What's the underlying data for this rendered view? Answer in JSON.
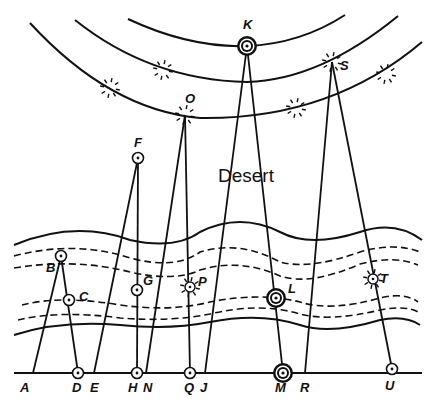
{
  "diagram": {
    "region_label": "Desert",
    "colors": {
      "ink": "#111111",
      "background": "#ffffff"
    },
    "baseline": {
      "y": 373,
      "x1": 14,
      "x2": 422
    },
    "arcs": [
      {
        "id": "inner",
        "path": "M128,19 Q190,48 247,46 Q300,44 345,15"
      },
      {
        "id": "middle",
        "path": "M75,20 Q150,80 247,82 Q320,80 398,16"
      },
      {
        "id": "outer",
        "path": "M30,23 Q110,110 200,118 Q330,120 422,42"
      }
    ],
    "river": {
      "solid": [
        "M14,245 Q75,220 130,240 Q175,250 200,232 Q240,212 280,232 Q310,248 360,232 Q395,220 422,240",
        "M14,335 Q60,320 120,325 Q170,330 210,322 Q260,312 300,325 Q330,335 380,320 Q405,315 420,325"
      ],
      "dashed": [
        "M14,256 Q75,240 130,258 Q175,270 200,252 Q240,240 280,262 Q310,270 360,252 Q395,242 420,252",
        "M14,268 Q75,258 130,272 Q175,282 200,270 Q240,258 280,276 Q310,286 360,264 Q395,255 418,265",
        "M22,305 Q60,295 120,305 Q170,312 210,302 Q260,292 300,302 Q330,312 380,298 Q405,292 418,302",
        "M18,320 Q60,310 120,318 Q170,322 210,314 Q260,302 300,314 Q330,322 380,310 Q405,305 418,312"
      ]
    },
    "points": [
      {
        "label": "A",
        "x": 33,
        "y": 373,
        "marker": "none",
        "lx": 20,
        "ly": 392
      },
      {
        "label": "B",
        "x": 61,
        "y": 256,
        "marker": "ring",
        "lx": 46,
        "ly": 272
      },
      {
        "label": "C",
        "x": 69,
        "y": 300,
        "marker": "ring",
        "lx": 79,
        "ly": 301
      },
      {
        "label": "D",
        "x": 78,
        "y": 373,
        "marker": "ring",
        "lx": 72,
        "ly": 392
      },
      {
        "label": "E",
        "x": 94,
        "y": 373,
        "marker": "none",
        "lx": 90,
        "ly": 392
      },
      {
        "label": "F",
        "x": 138,
        "y": 158,
        "marker": "ring",
        "lx": 134,
        "ly": 147
      },
      {
        "label": "G",
        "x": 137,
        "y": 290,
        "marker": "ring",
        "lx": 143,
        "ly": 285
      },
      {
        "label": "H",
        "x": 137,
        "y": 373,
        "marker": "ring",
        "lx": 128,
        "ly": 392
      },
      {
        "label": "N",
        "x": 146,
        "y": 373,
        "marker": "none",
        "lx": 143,
        "ly": 392
      },
      {
        "label": "O",
        "x": 185,
        "y": 115,
        "marker": "star",
        "lx": 185,
        "ly": 103
      },
      {
        "label": "P",
        "x": 190,
        "y": 287,
        "marker": "star",
        "lx": 198,
        "ly": 286
      },
      {
        "label": "Q",
        "x": 190,
        "y": 373,
        "marker": "ring",
        "lx": 184,
        "ly": 392
      },
      {
        "label": "J",
        "x": 205,
        "y": 373,
        "marker": "none",
        "lx": 200,
        "ly": 392
      },
      {
        "label": "K",
        "x": 247,
        "y": 46,
        "marker": "double-ring",
        "lx": 243,
        "ly": 29
      },
      {
        "label": "L",
        "x": 276,
        "y": 298,
        "marker": "double-ring",
        "lx": 288,
        "ly": 293
      },
      {
        "label": "M",
        "x": 283,
        "y": 373,
        "marker": "double-ring",
        "lx": 275,
        "ly": 392
      },
      {
        "label": "R",
        "x": 305,
        "y": 373,
        "marker": "none",
        "lx": 300,
        "ly": 392
      },
      {
        "label": "S",
        "x": 332,
        "y": 62,
        "marker": "star",
        "lx": 340,
        "ly": 70
      },
      {
        "label": "T",
        "x": 373,
        "y": 279,
        "marker": "star",
        "lx": 380,
        "ly": 283
      },
      {
        "label": "U",
        "x": 392,
        "y": 369,
        "marker": "ring",
        "lx": 385,
        "ly": 390
      }
    ],
    "edges": [
      [
        "A",
        "B"
      ],
      [
        "B",
        "D"
      ],
      [
        "E",
        "F"
      ],
      [
        "F",
        "H"
      ],
      [
        "N",
        "O"
      ],
      [
        "O",
        "Q"
      ],
      [
        "J",
        "K"
      ],
      [
        "K",
        "M"
      ],
      [
        "R",
        "S"
      ],
      [
        "S",
        "U"
      ]
    ],
    "extra_stars": [
      {
        "x": 110,
        "y": 88
      },
      {
        "x": 163,
        "y": 70
      },
      {
        "x": 296,
        "y": 108
      },
      {
        "x": 386,
        "y": 74
      }
    ]
  }
}
